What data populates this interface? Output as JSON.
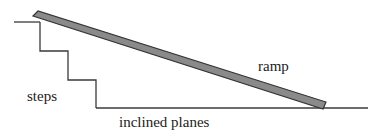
{
  "diagram": {
    "title": "inclined planes",
    "labels": {
      "ramp": "ramp",
      "steps": "steps",
      "caption": "inclined planes"
    },
    "colors": {
      "line": "#3a3a3a",
      "ramp_fill": "#8a8a8a",
      "ramp_edge": "#333333",
      "text": "#222222",
      "background": "#ffffff"
    },
    "geometry": {
      "top_ledge": {
        "x1": 14,
        "y1": 22,
        "x2": 40,
        "y2": 22
      },
      "steps_path": "M40,22 L40,51 L68,51 L68,80 L96,80 L96,108",
      "ground": {
        "x1": 96,
        "y1": 108,
        "x2": 368,
        "y2": 108
      },
      "ramp_polygon": "33,16 38,11 326,102 323,109"
    }
  }
}
